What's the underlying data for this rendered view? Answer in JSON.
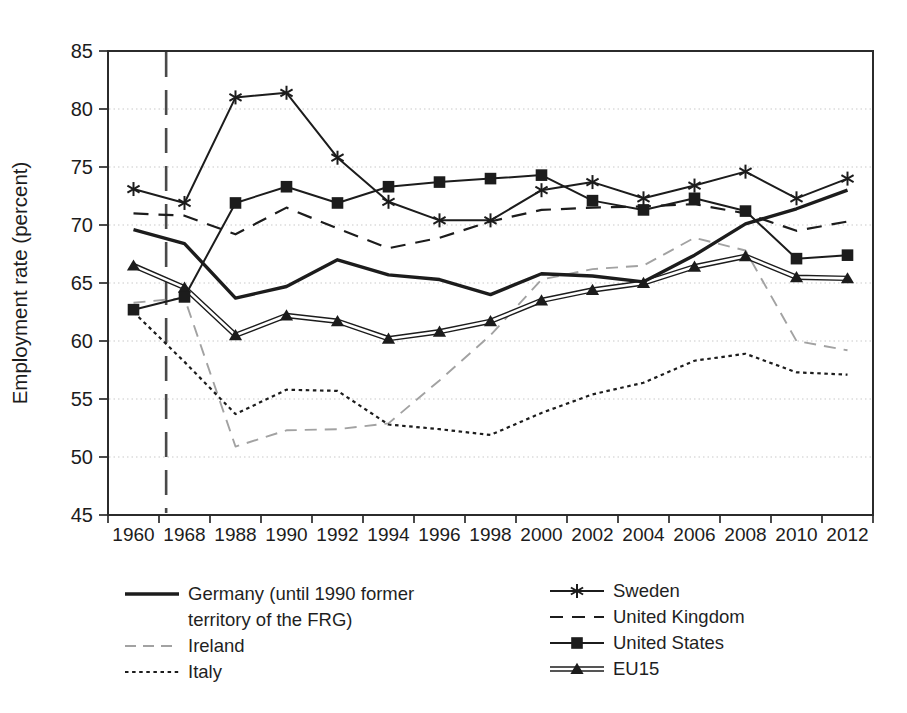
{
  "chart_data": {
    "type": "line",
    "title": "",
    "xlabel": "",
    "ylabel": "Employment rate (percent)",
    "ylim": [
      45,
      85
    ],
    "yticks": [
      45,
      50,
      55,
      60,
      65,
      70,
      75,
      80,
      85
    ],
    "gridlines_at": [
      50,
      55,
      60,
      65,
      70,
      75,
      80
    ],
    "grid": "horizontal-dotted-light",
    "categories": [
      "1960",
      "1968",
      "1988",
      "1990",
      "1992",
      "1994",
      "1996",
      "1998",
      "2000",
      "2002",
      "2004",
      "2006",
      "2008",
      "2010",
      "2012"
    ],
    "reference_line": {
      "orientation": "vertical",
      "style": "long-dash",
      "between_categories": [
        "1960",
        "1968"
      ],
      "fraction": 0.64,
      "color": "#4a4a4a"
    },
    "series": [
      {
        "id": "germany",
        "name": "Germany (until 1990 former territory of the FRG)",
        "style": "thick-solid",
        "marker": "none",
        "color": "#1c1c1c",
        "values": [
          69.6,
          68.4,
          63.7,
          64.7,
          67.0,
          65.7,
          65.3,
          64.0,
          65.8,
          65.6,
          65.1,
          67.4,
          70.1,
          71.4,
          73.0
        ]
      },
      {
        "id": "ireland",
        "name": "Ireland",
        "style": "gray-dash",
        "marker": "none",
        "color": "#a2a2a2",
        "values": [
          63.3,
          63.7,
          50.9,
          52.3,
          52.4,
          52.9,
          56.6,
          60.5,
          65.3,
          66.2,
          66.5,
          68.9,
          67.8,
          60.0,
          59.2
        ]
      },
      {
        "id": "italy",
        "name": "Italy",
        "style": "dotted",
        "marker": "none",
        "color": "#1c1c1c",
        "values": [
          62.5,
          58.2,
          53.7,
          55.8,
          55.7,
          52.8,
          52.4,
          51.9,
          53.8,
          55.4,
          56.4,
          58.3,
          58.9,
          57.3,
          57.1
        ]
      },
      {
        "id": "sweden",
        "name": "Sweden",
        "style": "solid",
        "marker": "asterisk",
        "color": "#1c1c1c",
        "values": [
          73.1,
          71.9,
          81.0,
          81.4,
          75.8,
          72.0,
          70.4,
          70.4,
          73.0,
          73.7,
          72.3,
          73.4,
          74.6,
          72.3,
          74.0
        ]
      },
      {
        "id": "united-kingdom",
        "name": "United Kingdom",
        "style": "long-dash",
        "marker": "none",
        "color": "#1c1c1c",
        "values": [
          71.0,
          70.8,
          69.2,
          71.5,
          69.7,
          68.0,
          68.9,
          70.3,
          71.3,
          71.5,
          71.6,
          71.8,
          71.0,
          69.5,
          70.3
        ]
      },
      {
        "id": "united-states",
        "name": "United States",
        "style": "solid",
        "marker": "square",
        "color": "#1c1c1c",
        "values": [
          62.7,
          63.8,
          71.9,
          73.3,
          71.9,
          73.3,
          73.7,
          74.0,
          74.3,
          72.1,
          71.3,
          72.3,
          71.2,
          67.1,
          67.4
        ]
      },
      {
        "id": "eu15",
        "name": "EU15",
        "style": "double-line",
        "marker": "triangle",
        "color": "#1c1c1c",
        "values": [
          66.5,
          64.6,
          60.5,
          62.2,
          61.7,
          60.2,
          60.8,
          61.7,
          63.5,
          64.4,
          65.0,
          66.4,
          67.3,
          65.5,
          65.4
        ]
      }
    ],
    "legend": {
      "position": "bottom",
      "columns": [
        [
          "germany",
          "ireland",
          "italy"
        ],
        [
          "sweden",
          "united-kingdom",
          "united-states",
          "eu15"
        ]
      ]
    }
  },
  "colors": {
    "ink": "#1c1c1c",
    "frame": "#2b2b2b",
    "grid": "#c9c9c9",
    "ireland_gray": "#a2a2a2",
    "reference_line": "#4a4a4a",
    "background": "#ffffff"
  }
}
